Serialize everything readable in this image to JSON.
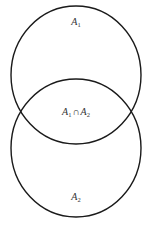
{
  "diagram": {
    "type": "venn",
    "stroke_color": "#1a1a1a",
    "background": "#ffffff",
    "sets": [
      {
        "id": "A1",
        "label_base": "A",
        "label_sub": "1",
        "cx": 76,
        "cy": 75,
        "rx": 65,
        "ry": 69,
        "label_x": 76,
        "label_y": 17
      },
      {
        "id": "A2",
        "label_base": "A",
        "label_sub": "2",
        "cx": 76,
        "cy": 148,
        "rx": 65,
        "ry": 69,
        "label_x": 76,
        "label_y": 192
      }
    ],
    "intersection": {
      "label_a_base": "A",
      "label_a_sub": "1",
      "operator": "∩",
      "label_b_base": "A",
      "label_b_sub": "2",
      "label_x": 76,
      "label_y": 107
    }
  }
}
